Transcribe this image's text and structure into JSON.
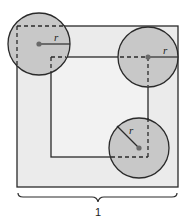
{
  "diagram": {
    "radius_label": "r",
    "side_label": "1",
    "colors": {
      "outer_fill": "#ebebeb",
      "inner_fill": "#f2f2f2",
      "circle_fill": "#c8c8c8",
      "stroke": "#2a2a2a",
      "dot": "#6a6a6a"
    },
    "outer_square": {
      "x": 17,
      "y": 26,
      "w": 161,
      "h": 161
    },
    "inner_square": {
      "x": 51,
      "y": 57,
      "w": 97,
      "h": 100
    },
    "circles": [
      {
        "name": "top-left",
        "cx": 39,
        "cy": 44,
        "r": 31
      },
      {
        "name": "top-right",
        "cx": 148,
        "cy": 57,
        "r": 30
      },
      {
        "name": "bottom-right",
        "cx": 139,
        "cy": 148,
        "r": 30
      }
    ]
  }
}
